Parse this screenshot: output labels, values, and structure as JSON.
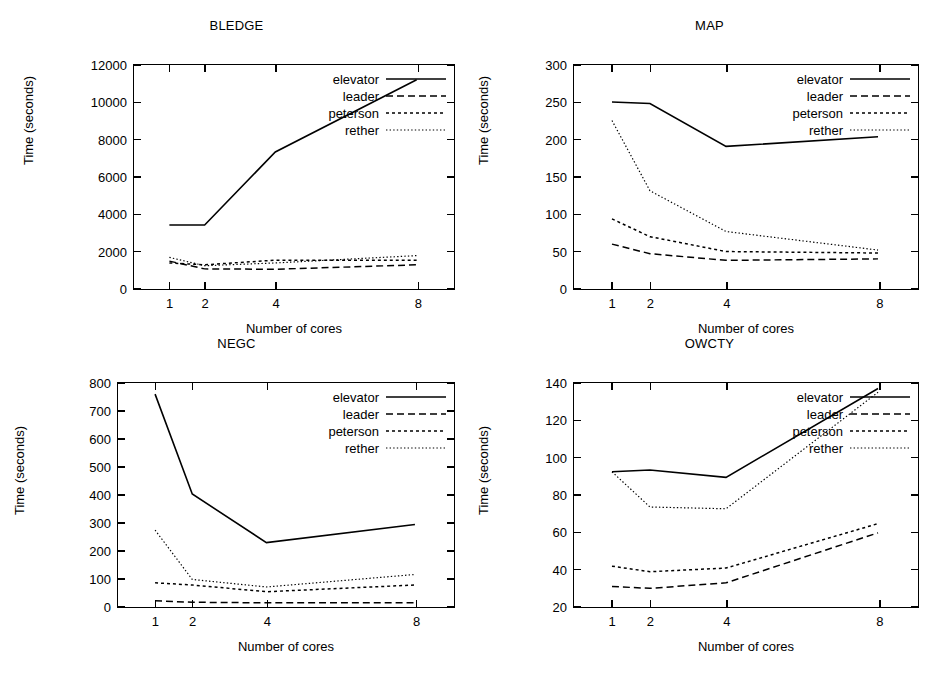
{
  "figure": {
    "xlabel": "Number of cores",
    "ylabel": "Time (seconds)",
    "series_names": [
      "elevator",
      "leader",
      "peterson",
      "rether"
    ],
    "line_color": "#000000"
  },
  "chart_data": [
    {
      "type": "line",
      "title": "BLEDGE",
      "xlabel": "Number of cores",
      "ylabel": "Time (seconds)",
      "x": [
        1,
        2,
        4,
        8
      ],
      "xticklabels": [
        "1",
        "2",
        "4",
        "8"
      ],
      "xlim": [
        0,
        9
      ],
      "ylim": [
        0,
        12000
      ],
      "yticks": [
        0,
        2000,
        4000,
        6000,
        8000,
        10000,
        12000
      ],
      "yticklabels": [
        "0",
        "2000",
        "4000",
        "6000",
        "8000",
        "10000",
        "12000"
      ],
      "grid": false,
      "legend_position": "upper right",
      "series": [
        {
          "name": "elevator",
          "style": "solid",
          "values": [
            3350,
            3350,
            7300,
            11200
          ]
        },
        {
          "name": "leader",
          "style": "dashed",
          "values": [
            1400,
            980,
            960,
            1200
          ]
        },
        {
          "name": "peterson",
          "style": "dotted",
          "values": [
            1300,
            1200,
            1450,
            1450
          ]
        },
        {
          "name": "rether",
          "style": "fine-dotted",
          "values": [
            1600,
            1150,
            1300,
            1700
          ]
        }
      ]
    },
    {
      "type": "line",
      "title": "MAP",
      "xlabel": "Number of cores",
      "ylabel": "Time (seconds)",
      "x": [
        1,
        2,
        4,
        8
      ],
      "xticklabels": [
        "1",
        "2",
        "4",
        "8"
      ],
      "xlim": [
        0,
        9
      ],
      "ylim": [
        0,
        300
      ],
      "yticks": [
        0,
        50,
        100,
        150,
        200,
        250,
        300
      ],
      "yticklabels": [
        "0",
        "50",
        "100",
        "150",
        "200",
        "250",
        "300"
      ],
      "grid": false,
      "legend_position": "upper right",
      "series": [
        {
          "name": "elevator",
          "style": "solid",
          "values": [
            250,
            248,
            190,
            203
          ]
        },
        {
          "name": "leader",
          "style": "dashed",
          "values": [
            58,
            45,
            36,
            38
          ]
        },
        {
          "name": "peterson",
          "style": "dotted",
          "values": [
            92,
            68,
            48,
            46
          ]
        },
        {
          "name": "rether",
          "style": "fine-dotted",
          "values": [
            225,
            130,
            75,
            50
          ]
        }
      ]
    },
    {
      "type": "line",
      "title": "NEGC",
      "xlabel": "Number of cores",
      "ylabel": "Time (seconds)",
      "x": [
        1,
        2,
        4,
        8
      ],
      "xticklabels": [
        "1",
        "2",
        "4",
        "8"
      ],
      "xlim": [
        0,
        9
      ],
      "ylim": [
        0,
        800
      ],
      "yticks": [
        0,
        100,
        200,
        300,
        400,
        500,
        600,
        700,
        800
      ],
      "yticklabels": [
        "0",
        "100",
        "200",
        "300",
        "400",
        "500",
        "600",
        "700",
        "800"
      ],
      "grid": false,
      "legend_position": "upper right",
      "series": [
        {
          "name": "elevator",
          "style": "solid",
          "values": [
            760,
            400,
            225,
            290
          ]
        },
        {
          "name": "leader",
          "style": "dashed",
          "values": [
            15,
            10,
            8,
            8
          ]
        },
        {
          "name": "peterson",
          "style": "dotted",
          "values": [
            80,
            72,
            48,
            72
          ]
        },
        {
          "name": "rether",
          "style": "fine-dotted",
          "values": [
            270,
            92,
            65,
            110
          ]
        }
      ]
    },
    {
      "type": "line",
      "title": "OWCTY",
      "xlabel": "Number of cores",
      "ylabel": "Time (seconds)",
      "x": [
        1,
        2,
        4,
        8
      ],
      "xticklabels": [
        "1",
        "2",
        "4",
        "8"
      ],
      "xlim": [
        0,
        9
      ],
      "ylim": [
        20,
        140
      ],
      "yticks": [
        20,
        40,
        60,
        80,
        100,
        120,
        140
      ],
      "yticklabels": [
        "20",
        "40",
        "60",
        "80",
        "100",
        "120",
        "140"
      ],
      "grid": false,
      "legend_position": "upper right",
      "series": [
        {
          "name": "elevator",
          "style": "solid",
          "values": [
            92,
            93,
            89,
            137
          ]
        },
        {
          "name": "leader",
          "style": "dashed",
          "values": [
            30,
            29,
            32,
            59
          ]
        },
        {
          "name": "peterson",
          "style": "dotted",
          "values": [
            41,
            38,
            40,
            64
          ]
        },
        {
          "name": "rether",
          "style": "fine-dotted",
          "values": [
            92,
            73,
            72,
            135
          ]
        }
      ]
    }
  ]
}
